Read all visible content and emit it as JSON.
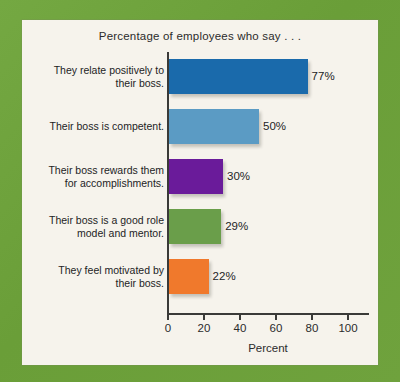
{
  "figure": {
    "border_color": "#6ea33c",
    "panel_color": "#f6f3ec"
  },
  "chart_data": {
    "type": "bar",
    "orientation": "horizontal",
    "title": "Percentage of employees who say . . .",
    "xlabel": "Percent",
    "ylabel": "",
    "xlim": [
      0,
      110
    ],
    "xticks": [
      0,
      20,
      40,
      60,
      80,
      100
    ],
    "xtick_labels": [
      "0",
      "20",
      "40",
      "60",
      "80",
      "100"
    ],
    "grid": false,
    "legend": false,
    "categories": [
      "They relate positively to their boss.",
      "Their boss is competent.",
      "Their boss rewards them for accomplishments.",
      "Their boss is a good role model and mentor.",
      "They feel motivated by their boss."
    ],
    "values": [
      77,
      50,
      30,
      29,
      22
    ],
    "value_labels": [
      "77%",
      "50%",
      "30%",
      "29%",
      "22%"
    ],
    "colors": [
      "#1a6aab",
      "#5b9bc4",
      "#6a1b9a",
      "#6a9e4a",
      "#f0792c"
    ],
    "bars": [
      {
        "label_line1": "They relate positively to",
        "label_line2": "their boss.",
        "value": 77,
        "value_label": "77%",
        "color": "#1a6aab"
      },
      {
        "label_line1": "Their boss is competent.",
        "label_line2": "",
        "value": 50,
        "value_label": "50%",
        "color": "#5b9bc4"
      },
      {
        "label_line1": "Their boss rewards them",
        "label_line2": "for accomplishments.",
        "value": 30,
        "value_label": "30%",
        "color": "#6a1b9a"
      },
      {
        "label_line1": "Their boss is a good role",
        "label_line2": "model and mentor.",
        "value": 29,
        "value_label": "29%",
        "color": "#6a9e4a"
      },
      {
        "label_line1": "They feel motivated by",
        "label_line2": "their boss.",
        "value": 22,
        "value_label": "22%",
        "color": "#f0792c"
      }
    ]
  }
}
